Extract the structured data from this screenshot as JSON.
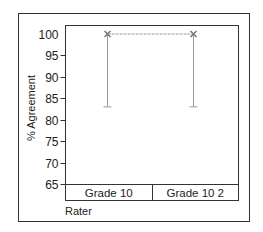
{
  "chart_data": {
    "type": "line",
    "title": "",
    "xlabel": "Rater",
    "ylabel": "% Agreement",
    "categories": [
      "Grade 10",
      "Grade 10 2"
    ],
    "series": [
      {
        "name": "% Agreement",
        "values": [
          100,
          100
        ],
        "error_low": [
          83,
          83
        ],
        "error_high": [
          100,
          100
        ],
        "marker": "x",
        "color": "#888888"
      }
    ],
    "ylim": [
      65,
      100
    ],
    "yticks": [
      65,
      70,
      75,
      80,
      85,
      90,
      95,
      100
    ],
    "grid": false,
    "legend": "none"
  },
  "colors": {
    "frame": "#333333",
    "series": "#999999",
    "marker": "#777777"
  }
}
